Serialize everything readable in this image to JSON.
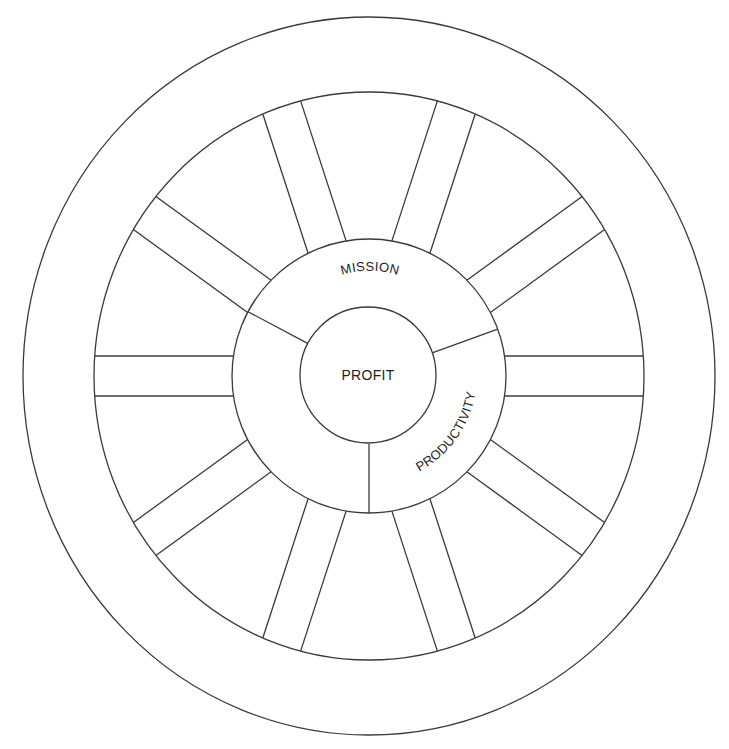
{
  "figure": {
    "type": "wheel-diagram",
    "width": 729,
    "height": 749,
    "stroke_color": "#3a3a3a",
    "background": "#ffffff"
  },
  "labels": {
    "center": "PROFIT",
    "hub_top": "MISSION",
    "hub_right": "PRODUCTIVITY"
  },
  "geometry": {
    "center": [
      369,
      376
    ],
    "outer_tire": {
      "rx": 346,
      "ry": 359
    },
    "inner_rim": {
      "rx": 275,
      "ry": 284
    },
    "hub": {
      "r": 137
    },
    "core": {
      "r": 68
    },
    "spoke_count": 10,
    "spoke_half_width": 20,
    "spoke_start_angle_deg": 0,
    "hub_dividers_deg": [
      152,
      20,
      270
    ]
  }
}
